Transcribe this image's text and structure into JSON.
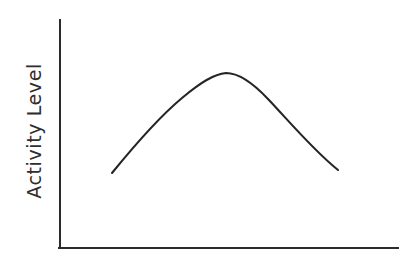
{
  "figure": {
    "width": 409,
    "height": 262,
    "background_color": "#ffffff",
    "axis_color": "#2b2b2b",
    "curve_color": "#252525"
  },
  "chart_data": {
    "type": "line",
    "title": "",
    "xlabel": "",
    "ylabel": "Activity Level",
    "grid": false,
    "legend": null,
    "tick_labels_x": [],
    "tick_labels_y": [],
    "xlim": [
      0,
      1
    ],
    "ylim": [
      0,
      1
    ],
    "annotations": [],
    "series": [
      {
        "name": "Activity Level",
        "shape": "inverted-u",
        "x": [
          0.154,
          0.222,
          0.296,
          0.37,
          0.444,
          0.488,
          0.533,
          0.6,
          0.666,
          0.725,
          0.784,
          0.834,
          0.882,
          0.925,
          0.97
        ],
        "y": [
          0.329,
          0.451,
          0.561,
          0.652,
          0.724,
          0.756,
          0.776,
          0.79,
          0.772,
          0.731,
          0.668,
          0.597,
          0.512,
          0.427,
          0.342
        ]
      }
    ]
  },
  "geometry": {
    "y_axis": {
      "x": 60,
      "y_top": 20,
      "y_bottom": 248
    },
    "x_axis": {
      "y": 248,
      "x_left": 60,
      "x_right": 398
    },
    "curve_path": "M 112,173 C 134,146 158,118 182,98 C 201,82 214,74 226,73 C 239,73 252,82 268,99 C 288,120 313,150 338,170",
    "ylabel_position": {
      "x": 33,
      "y": 130,
      "rotation_deg": -90
    }
  }
}
